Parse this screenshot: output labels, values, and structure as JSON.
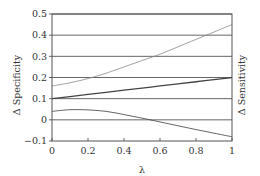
{
  "chart_data": {
    "type": "line",
    "title": "",
    "xlabel": "λ",
    "ylabel": "Δ Specificity",
    "ylabel_right": "Δ Sensitivity",
    "xlim": [
      0,
      1
    ],
    "ylim": [
      -0.1,
      0.5
    ],
    "x_ticks": [
      0,
      0.2,
      0.4,
      0.6,
      0.8,
      1
    ],
    "x_tick_labels": [
      "0",
      "0.2",
      "0.4",
      "0.6",
      "0.8",
      "1"
    ],
    "y_ticks": [
      -0.1,
      0,
      0.1,
      0.2,
      0.3,
      0.4,
      0.5
    ],
    "y_tick_labels": [
      "−0.1",
      "0",
      "0.1",
      "0.2",
      "0.3",
      "0.4",
      "0.5"
    ],
    "grid": "horizontal",
    "legend": "none",
    "x": [
      0,
      0.1,
      0.2,
      0.3,
      0.4,
      0.5,
      0.6,
      0.7,
      0.8,
      0.9,
      1.0
    ],
    "series": [
      {
        "name": "upper curve",
        "color": "#8a8a8a",
        "width": 0.8,
        "values": [
          0.16,
          0.175,
          0.195,
          0.22,
          0.25,
          0.28,
          0.31,
          0.345,
          0.38,
          0.415,
          0.45
        ]
      },
      {
        "name": "middle line",
        "color": "#444444",
        "width": 1.3,
        "values": [
          0.1,
          0.11,
          0.12,
          0.13,
          0.14,
          0.15,
          0.16,
          0.17,
          0.18,
          0.19,
          0.2
        ]
      },
      {
        "name": "lower curve",
        "color": "#555555",
        "width": 0.9,
        "values": [
          0.04,
          0.048,
          0.047,
          0.04,
          0.025,
          0.008,
          -0.01,
          -0.028,
          -0.046,
          -0.063,
          -0.08
        ]
      }
    ]
  },
  "colors": {
    "axis": "#555555",
    "grid": "#555555",
    "text": "#333333"
  }
}
